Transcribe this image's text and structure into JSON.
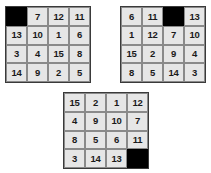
{
  "scene": {
    "title": "15-Puzzle Board States",
    "background_color": "#ffffff",
    "cell_color": "#e6e6e6",
    "blank_color": "#000000",
    "border_color": "#3a3a3a",
    "grid_line_color": "#8a8a8a",
    "text_color": "#1a1a1a"
  },
  "puzzles": [
    {
      "name": "puzzle-left",
      "rows": 4,
      "columns": 4,
      "blank_position": {
        "row": 0,
        "col": 0
      },
      "cells": [
        "",
        "7",
        "12",
        "11",
        "13",
        "10",
        "1",
        "6",
        "3",
        "4",
        "15",
        "8",
        "14",
        "9",
        "2",
        "5"
      ]
    },
    {
      "name": "puzzle-right",
      "rows": 4,
      "columns": 4,
      "blank_position": {
        "row": 0,
        "col": 2
      },
      "cells": [
        "6",
        "11",
        "",
        "13",
        "1",
        "12",
        "7",
        "10",
        "15",
        "2",
        "9",
        "4",
        "8",
        "5",
        "14",
        "3"
      ]
    },
    {
      "name": "puzzle-bottom",
      "rows": 4,
      "columns": 4,
      "blank_position": {
        "row": 3,
        "col": 3
      },
      "cells": [
        "15",
        "2",
        "1",
        "12",
        "4",
        "9",
        "10",
        "7",
        "8",
        "5",
        "6",
        "11",
        "3",
        "14",
        "13",
        ""
      ]
    }
  ]
}
